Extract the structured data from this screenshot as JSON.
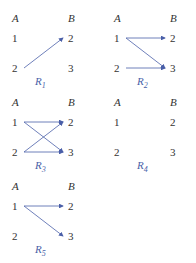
{
  "diagrams": [
    {
      "name": "R",
      "sub": "1",
      "left_header": "A",
      "right_header": "B",
      "left": [
        "1",
        "2"
      ],
      "right": [
        "2",
        "3"
      ],
      "edges": [
        [
          "2",
          "2"
        ]
      ]
    },
    {
      "name": "R",
      "sub": "2",
      "left_header": "A",
      "right_header": "B",
      "left": [
        "1",
        "2"
      ],
      "right": [
        "2",
        "3"
      ],
      "edges": [
        [
          "1",
          "2"
        ],
        [
          "1",
          "3"
        ],
        [
          "2",
          "3"
        ]
      ]
    },
    {
      "name": "R",
      "sub": "3",
      "left_header": "A",
      "right_header": "B",
      "left": [
        "1",
        "2"
      ],
      "right": [
        "2",
        "3"
      ],
      "edges": [
        [
          "1",
          "2"
        ],
        [
          "1",
          "3"
        ],
        [
          "2",
          "2"
        ],
        [
          "2",
          "3"
        ]
      ]
    },
    {
      "name": "R",
      "sub": "4",
      "left_header": "A",
      "right_header": "B",
      "left": [
        "1",
        "2"
      ],
      "right": [
        "2",
        "3"
      ],
      "edges": []
    },
    {
      "name": "R",
      "sub": "5",
      "left_header": "A",
      "right_header": "B",
      "left": [
        "1",
        "2"
      ],
      "right": [
        "2",
        "3"
      ],
      "edges": [
        [
          "1",
          "2"
        ],
        [
          "1",
          "3"
        ]
      ]
    }
  ],
  "colors": {
    "arrow": "#4a5fa8",
    "label": "#4a5fa8",
    "text": "#333333"
  }
}
